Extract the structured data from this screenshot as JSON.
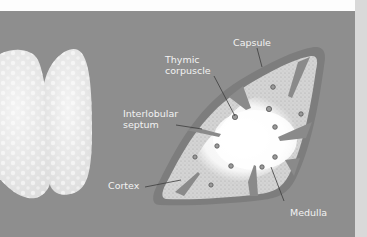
{
  "figure": {
    "colors": {
      "background": "#8e8e8e",
      "top_band": "#fdfdfd",
      "right_strip": "#d9d9d9",
      "lobe_fill": "#e6e6e6",
      "capsule": "#7d7d7d",
      "cortex": "#cfcfcf",
      "medulla": "#f7f7f7",
      "label_text": "#f2f2f2",
      "leader_line": "#3c3c3c"
    }
  },
  "labels": {
    "capsule": "Capsule",
    "thymic_corpuscle_line1": "Thymic",
    "thymic_corpuscle_line2": "corpuscle",
    "interlobular_line1": "Interlobular",
    "interlobular_line2": "septum",
    "cortex": "Cortex",
    "medulla": "Medulla"
  }
}
